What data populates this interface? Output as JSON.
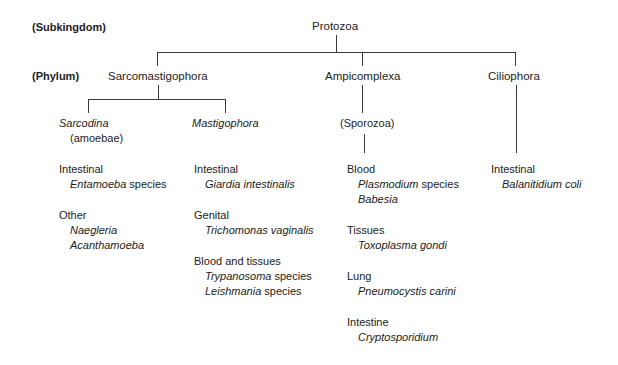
{
  "rank_labels": {
    "subkingdom": "(Subkingdom)",
    "phylum": "(Phylum)"
  },
  "root": "Protozoa",
  "phyla": [
    {
      "name": "Sarcomastigophora",
      "subgroups": [
        {
          "name": "Sarcodina",
          "note": "(amoebae)",
          "sites": [
            {
              "site": "Intestinal",
              "organisms": [
                {
                  "genus": "Entamoeba",
                  "suffix": " species"
                }
              ]
            },
            {
              "site": "Other",
              "organisms": [
                {
                  "genus": "Naegleria",
                  "suffix": ""
                },
                {
                  "genus": "Acanthamoeba",
                  "suffix": ""
                }
              ]
            }
          ]
        },
        {
          "name": "Mastigophora",
          "sites": [
            {
              "site": "Intestinal",
              "organisms": [
                {
                  "genus": "Giardia intestinalis",
                  "suffix": ""
                }
              ]
            },
            {
              "site": "Genital",
              "organisms": [
                {
                  "genus": "Trichomonas vaginalis",
                  "suffix": ""
                }
              ]
            },
            {
              "site": "Blood and tissues",
              "organisms": [
                {
                  "genus": "Trypanosoma",
                  "suffix": " species"
                },
                {
                  "genus": "Leishmania",
                  "suffix": " species"
                }
              ]
            }
          ]
        }
      ]
    },
    {
      "name": "Ampicomplexa",
      "subgroup": "(Sporozoa)",
      "sites": [
        {
          "site": "Blood",
          "organisms": [
            {
              "genus": "Plasmodium",
              "suffix": " species"
            },
            {
              "genus": "Babesia",
              "suffix": ""
            }
          ]
        },
        {
          "site": "Tissues",
          "organisms": [
            {
              "genus": "Toxoplasma gondi",
              "suffix": ""
            }
          ]
        },
        {
          "site": "Lung",
          "organisms": [
            {
              "genus": "Pneumocystis carini",
              "suffix": ""
            }
          ]
        },
        {
          "site": "Intestine",
          "organisms": [
            {
              "genus": "Cryptosporidium",
              "suffix": ""
            }
          ]
        }
      ]
    },
    {
      "name": "Ciliophora",
      "sites": [
        {
          "site": "Intestinal",
          "organisms": [
            {
              "genus": "Balanitidium coli",
              "suffix": ""
            }
          ]
        }
      ]
    }
  ]
}
